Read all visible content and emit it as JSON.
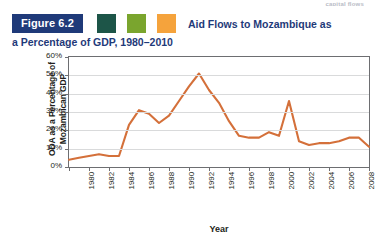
{
  "running_head": "capital flows",
  "figure": {
    "badge_label": "Figure 6.2",
    "title_line1": "Aid Flows to Mozambique as",
    "title_line2": "a Percentage of GDP, 1980–2010",
    "badge_color": "#1f3a79",
    "title_color": "#1f3a79",
    "swatches": [
      {
        "name": "swatch-dark-green",
        "color": "#1d5548"
      },
      {
        "name": "swatch-olive-green",
        "color": "#7aa52e"
      },
      {
        "name": "swatch-orange",
        "color": "#f5a33c"
      }
    ]
  },
  "chart_data": {
    "type": "line",
    "title": "Aid Flows to Mozambique as a Percentage of GDP, 1980–2010",
    "xlabel": "Year",
    "ylabel": "ODA as a Percentage of Mozambican GDP",
    "line_color": "#d4703a",
    "grid": true,
    "legend": "none",
    "ylim": [
      0,
      60
    ],
    "xlim": [
      1980,
      2010
    ],
    "ytick_labels": [
      "60%",
      "50%",
      "40%",
      "30%",
      "20%",
      "10%",
      "0%"
    ],
    "ytick_values": [
      60,
      50,
      40,
      30,
      20,
      10,
      0
    ],
    "xtick_labels": [
      "1980",
      "1982",
      "1984",
      "1986",
      "1988",
      "1990",
      "1992",
      "1994",
      "1996",
      "1998",
      "2000",
      "2002",
      "2004",
      "2006",
      "2008",
      "2010"
    ],
    "xtick_values": [
      1980,
      1982,
      1984,
      1986,
      1988,
      1990,
      1992,
      1994,
      1996,
      1998,
      2000,
      2002,
      2004,
      2006,
      2008,
      2010
    ],
    "x": [
      1980,
      1981,
      1982,
      1983,
      1984,
      1985,
      1986,
      1987,
      1988,
      1989,
      1990,
      1991,
      1992,
      1993,
      1994,
      1995,
      1996,
      1997,
      1998,
      1999,
      2000,
      2001,
      2002,
      2003,
      2004,
      2005,
      2006,
      2007,
      2008,
      2009,
      2010
    ],
    "values": [
      4,
      5,
      6,
      7,
      6,
      6,
      23,
      31,
      29,
      24,
      28,
      36,
      44,
      51,
      42,
      35,
      25,
      17,
      16,
      16,
      19,
      17,
      36,
      14,
      12,
      13,
      13,
      14,
      16,
      16,
      11
    ],
    "series": [
      {
        "name": "ODA as a percentage of Mozambican GDP",
        "color": "#d4703a",
        "values": [
          4,
          5,
          6,
          7,
          6,
          6,
          23,
          31,
          29,
          24,
          28,
          36,
          44,
          51,
          42,
          35,
          25,
          17,
          16,
          16,
          19,
          17,
          36,
          14,
          12,
          13,
          13,
          14,
          16,
          16,
          11
        ]
      }
    ]
  }
}
